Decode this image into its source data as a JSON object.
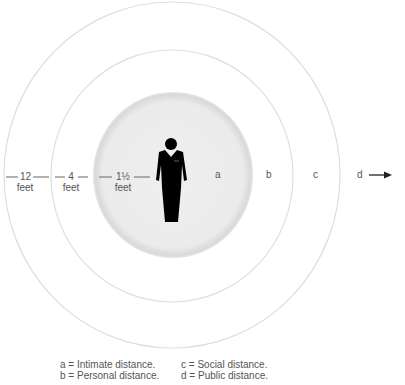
{
  "diagram": {
    "center_figure": "person-icon",
    "distances": [
      {
        "value": "12",
        "unit": "feet"
      },
      {
        "value": "4",
        "unit": "feet"
      },
      {
        "value": "1½",
        "unit": "feet"
      }
    ],
    "zones": [
      "a",
      "b",
      "c",
      "d"
    ],
    "arrow_icon": "right-arrow-icon",
    "legend": [
      {
        "key": "a",
        "text": "a = Intimate distance."
      },
      {
        "key": "b",
        "text": "b = Personal distance."
      },
      {
        "key": "c",
        "text": "c = Social distance."
      },
      {
        "key": "d",
        "text": "d = Public distance."
      }
    ],
    "colors": {
      "inner_fill": "#ececec",
      "ring_stroke": "#dddddd",
      "figure": "#000000",
      "text": "#555555"
    }
  }
}
